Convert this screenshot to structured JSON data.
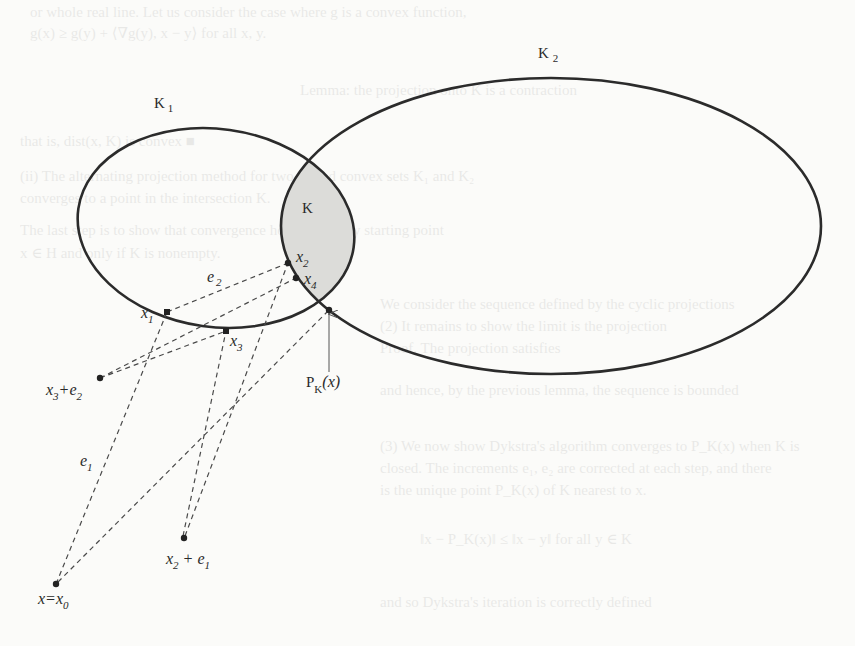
{
  "figure": {
    "sets": {
      "k1": {
        "label": "K",
        "sub": "1"
      },
      "k2": {
        "label": "K",
        "sub": "2"
      },
      "k": {
        "label": "K"
      }
    },
    "points": {
      "x0": {
        "label": "x=x",
        "sub": "0"
      },
      "x1": {
        "label": "x",
        "sub": "1"
      },
      "x2": {
        "label": "x",
        "sub": "2"
      },
      "x3": {
        "label": "x",
        "sub": "3"
      },
      "x4": {
        "label": "x",
        "sub": "4"
      },
      "x3e2": {
        "label_a": "x",
        "sub_a": "3",
        "label_b": "+e",
        "sub_b": "2"
      },
      "x2e1": {
        "label_a": "x",
        "sub_a": "2",
        "label_b": " + e",
        "sub_b": "1"
      },
      "pk": {
        "label_a": "P",
        "sub_a": "K",
        "label_b": "(x)"
      }
    },
    "vectors": {
      "e1": {
        "label": "e",
        "sub": "1"
      },
      "e2": {
        "label": "e",
        "sub": "2"
      }
    },
    "colors": {
      "stroke": "#2b2b2b",
      "dash": "#444444",
      "intersection_fill": "#d9d9d6",
      "background": "#fbfbf9"
    }
  },
  "bleed_through": [
    "or whole real line. Let us consider the case where g is a convex function,",
    "g(x) ≥ g(y) + ⟨∇g(y), x − y⟩ for all x, y.",
    "Lemma: the projection onto K is a contraction",
    "that is, dist(x, K) is convex   ■",
    "(ii) The alternating projection method for two closed convex sets K₁ and K₂",
    "converges to a point in the intersection K.",
    "The last step is to show that convergence holds for every starting point",
    "x ∈ H and only if K is nonempty.",
    "We consider the sequence defined by the cyclic projections",
    "(2) It remains to show the limit is the projection",
    "Proof. The projection satisfies",
    "and hence, by the previous lemma, the sequence is bounded",
    "(3) We now show Dykstra's algorithm converges to P_K(x) when K is",
    "closed. The increments e₁, e₂ are corrected at each step, and there",
    "is the unique point P_K(x) of K nearest to x.",
    "‖x − P_K(x)‖ ≤ ‖x − y‖ for all y ∈ K",
    "and so Dykstra's iteration is correctly defined"
  ]
}
